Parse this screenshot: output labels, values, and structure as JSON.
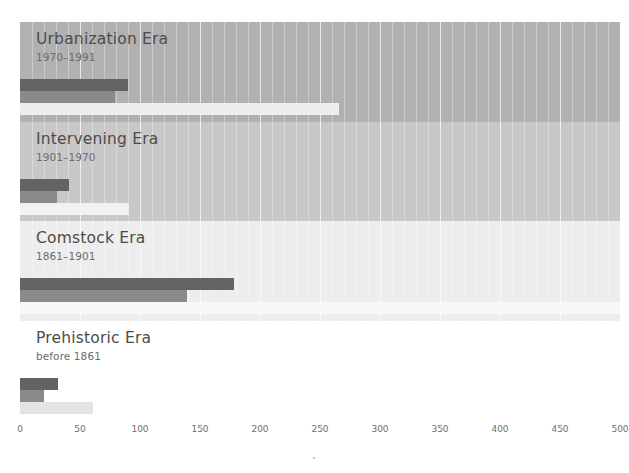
{
  "chart_data": {
    "type": "bar",
    "title": "",
    "subtitle": "",
    "xlabel": "",
    "ylabel": "",
    "orientation": "horizontal",
    "xlim": [
      0,
      500
    ],
    "xticks": [
      0,
      50,
      100,
      150,
      200,
      250,
      300,
      350,
      400,
      450,
      500
    ],
    "xtick_labels": [
      "0",
      "50",
      "100",
      "150",
      "200",
      "250",
      "300",
      "350",
      "400",
      "450",
      "500"
    ],
    "grid": true,
    "grid_minor": true,
    "legend": "none",
    "panels": [
      {
        "id": "urbanization-era",
        "label": "Urbanization Era",
        "period": "1970–1991",
        "panel_color": "#b1b1b1",
        "series": [
          {
            "name": "dark",
            "value": 90,
            "color": "#636363"
          },
          {
            "name": "medium",
            "value": 79,
            "color": "#8a8a8a"
          },
          {
            "name": "light",
            "value": 266,
            "color": "#eeeeee"
          }
        ]
      },
      {
        "id": "intervening-era",
        "label": "Intervening Era",
        "period": "1901–1970",
        "panel_color": "#c8c8c8",
        "series": [
          {
            "name": "dark",
            "value": 41,
            "color": "#636363"
          },
          {
            "name": "medium",
            "value": 31,
            "color": "#8a8a8a"
          },
          {
            "name": "light",
            "value": 91,
            "color": "#f1f1f1"
          }
        ]
      },
      {
        "id": "comstock-era",
        "label": "Comstock Era",
        "period": "1861–1901",
        "panel_color": "#ededed",
        "series": [
          {
            "name": "dark",
            "value": 178,
            "color": "#636363"
          },
          {
            "name": "medium",
            "value": 139,
            "color": "#8a8a8a"
          },
          {
            "name": "light",
            "value": 500,
            "color": "#f7f7f7"
          }
        ]
      },
      {
        "id": "prehistoric-era",
        "label": "Prehistoric Era",
        "period": "before 1861",
        "panel_color": "#ffffff",
        "series": [
          {
            "name": "dark",
            "value": 32,
            "color": "#636363"
          },
          {
            "name": "medium",
            "value": 20,
            "color": "#8a8a8a"
          },
          {
            "name": "light",
            "value": 61,
            "color": "#e4e4e4"
          }
        ]
      }
    ]
  },
  "axis": {
    "tick_labels": [
      "0",
      "50",
      "100",
      "150",
      "200",
      "250",
      "300",
      "350",
      "400",
      "450",
      "500"
    ]
  },
  "colors": {
    "dark_bar": "#636363",
    "medium_bar": "#8a8a8a",
    "tick_text": "#6e6e6e",
    "title_text": "#4c4c4c",
    "subtitle_text": "#6b6b6b"
  }
}
